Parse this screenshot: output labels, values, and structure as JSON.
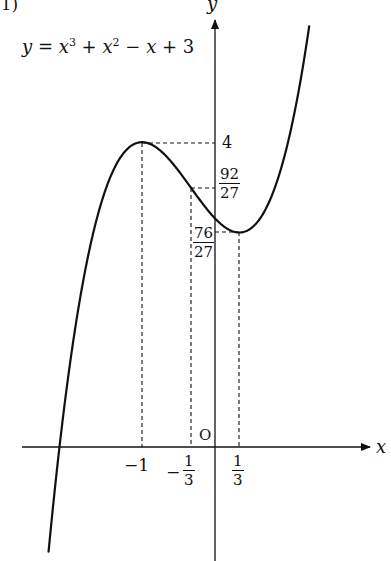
{
  "problem_label": "(1)",
  "equation": {
    "lhs": "y",
    "rhs_parts": [
      "x",
      "3",
      "+",
      "x",
      "2",
      "−",
      "x",
      "+ 3"
    ]
  },
  "axes": {
    "x_label": "x",
    "y_label": "y",
    "origin_label": "O"
  },
  "y_ticks": {
    "four": "4",
    "frac_92_27": {
      "num": "92",
      "den": "27"
    },
    "frac_76_27": {
      "num": "76",
      "den": "27"
    }
  },
  "x_ticks": {
    "minus_one": "−1",
    "minus_third": {
      "sign": "−",
      "num": "1",
      "den": "3"
    },
    "third": {
      "num": "1",
      "den": "3"
    }
  },
  "chart_data": {
    "type": "line",
    "function": "x^3 + x^2 - x + 3",
    "xlabel": "x",
    "ylabel": "y",
    "xlim": [
      -2.1,
      2.3
    ],
    "ylim": [
      -1.5,
      5.8
    ],
    "grid": false,
    "legend": null,
    "annotations": [
      {
        "point": [
          -1,
          4
        ],
        "label": "local max",
        "dashed_guides": true
      },
      {
        "point": [
          -0.3333,
          3.4074
        ],
        "label": "inflection (92/27)",
        "dashed_guides": true
      },
      {
        "point": [
          0.3333,
          2.8148
        ],
        "label": "local min (76/27)",
        "dashed_guides": true
      }
    ],
    "x_tick_labels": [
      "-1",
      "-1/3",
      "1/3"
    ],
    "y_tick_labels": [
      "4",
      "92/27",
      "76/27"
    ],
    "series": [
      {
        "name": "y = x^3 + x^2 - x + 3",
        "x": [
          -2.1,
          -2.0,
          -1.8,
          -1.6,
          -1.4,
          -1.2,
          -1.0,
          -0.8,
          -0.6,
          -0.3333,
          0.0,
          0.3333,
          0.6,
          0.8,
          1.0,
          1.2
        ],
        "y": [
          -0.951,
          1.0,
          2.328,
          3.064,
          3.376,
          3.912,
          4.0,
          3.928,
          3.784,
          3.407,
          3.0,
          2.815,
          3.176,
          3.552,
          4.0,
          5.168
        ]
      }
    ]
  }
}
